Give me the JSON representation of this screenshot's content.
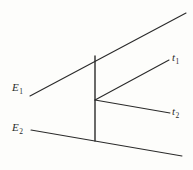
{
  "figure": {
    "background_color": "#fdfdfb",
    "line_color": "#2a2a2a",
    "labels": {
      "incoming_upper": {
        "base": "E",
        "sub": "1"
      },
      "incoming_lower": {
        "base": "E",
        "sub": "2"
      },
      "outgoing_upper": {
        "base": "t",
        "sub": "1"
      },
      "outgoing_lower": {
        "base": "t",
        "sub": "2"
      }
    }
  },
  "chart_data": {
    "type": "line",
    "title": "",
    "xlabel": "",
    "ylabel": "",
    "xlim": [
      0,
      193
    ],
    "ylim": [
      170,
      0
    ],
    "grid": false,
    "legend": "none",
    "series": [
      {
        "name": "E1-incoming-ray",
        "label": "E₁",
        "x": [
          30,
          186
        ],
        "y": [
          96,
          13
        ],
        "width": 1.1
      },
      {
        "name": "E2-incoming-ray",
        "label": "E₂",
        "x": [
          31,
          182
        ],
        "y": [
          130,
          156
        ],
        "width": 1.1
      },
      {
        "name": "vertical-connector",
        "label": "",
        "x": [
          95,
          95
        ],
        "y": [
          56,
          141
        ],
        "width": 1.4
      },
      {
        "name": "t1-outgoing-ray",
        "label": "t₁",
        "x": [
          95,
          169
        ],
        "y": [
          100,
          60
        ],
        "width": 1.1
      },
      {
        "name": "t2-outgoing-ray",
        "label": "t₂",
        "x": [
          95,
          170
        ],
        "y": [
          100,
          113
        ],
        "width": 1.1
      }
    ],
    "annotations": [
      {
        "text": "E₁",
        "x": 17,
        "y": 88
      },
      {
        "text": "E₂",
        "x": 17,
        "y": 128
      },
      {
        "text": "t₁",
        "x": 175,
        "y": 58
      },
      {
        "text": "t₂",
        "x": 175,
        "y": 112
      }
    ],
    "vertex": {
      "x": 95,
      "y": 100
    }
  }
}
